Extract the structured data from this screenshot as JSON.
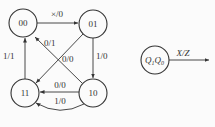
{
  "diagram": {
    "type": "state-transition-diagram",
    "states": [
      {
        "id": "00",
        "label": "00",
        "cx": 23,
        "cy": 23
      },
      {
        "id": "01",
        "label": "01",
        "cx": 93,
        "cy": 24
      },
      {
        "id": "11",
        "label": "11",
        "cx": 25,
        "cy": 93
      },
      {
        "id": "10",
        "label": "10",
        "cx": 93,
        "cy": 93
      }
    ],
    "transitions": [
      {
        "from": "00",
        "to": "01",
        "label": "×/0"
      },
      {
        "from": "01",
        "to": "10",
        "label": "1/0"
      },
      {
        "from": "01",
        "to": "11",
        "label": "0/0"
      },
      {
        "from": "10",
        "to": "00",
        "label": "0/1"
      },
      {
        "from": "10",
        "to": "11",
        "label": "0/0"
      },
      {
        "from": "10",
        "to": "11",
        "label": "1/0"
      },
      {
        "from": "11",
        "to": "00",
        "label": "1/1"
      }
    ],
    "legend": {
      "state_label_main": "Q",
      "sub1": "1",
      "sub0": "0",
      "arrow_label": "X/Z"
    }
  }
}
